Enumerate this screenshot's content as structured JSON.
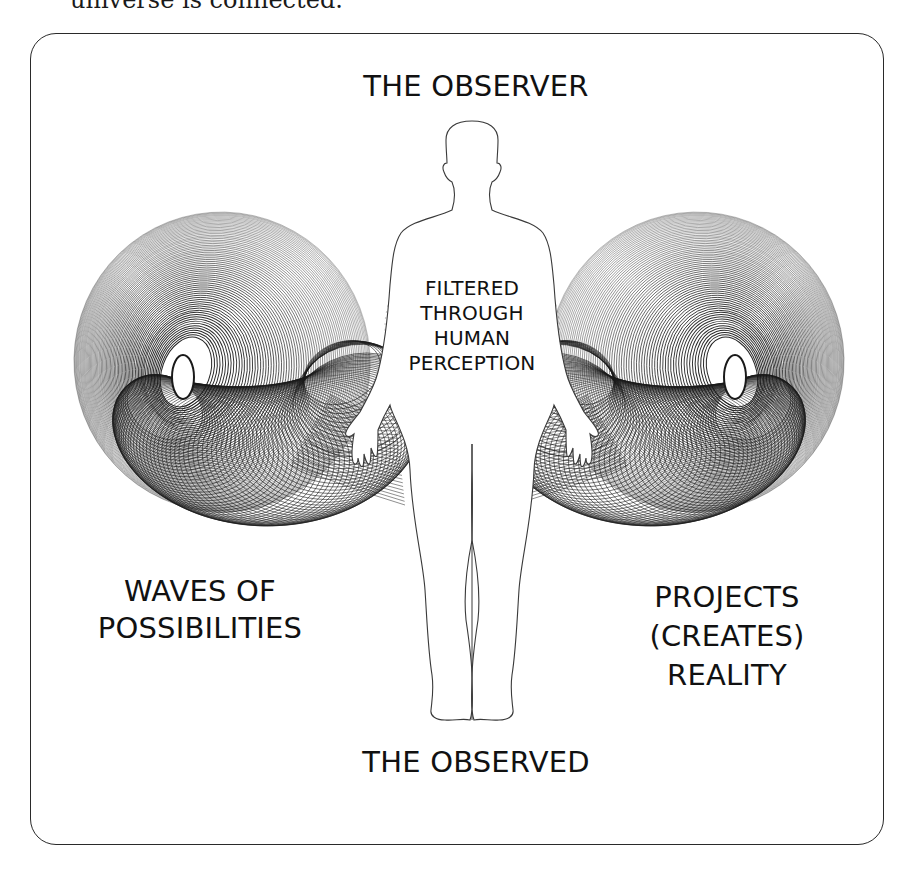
{
  "caption": {
    "text": "universe is connected."
  },
  "diagram": {
    "top_label": "THE OBSERVER",
    "bottom_label": "THE OBSERVED",
    "center_label_lines": [
      "FILTERED",
      "THROUGH",
      "HUMAN",
      "PERCEPTION"
    ],
    "left_label_lines": [
      "WAVES OF",
      "POSSIBILITIES"
    ],
    "right_label_lines": [
      "PROJECTS",
      "(CREATES)",
      "REALITY"
    ]
  },
  "style": {
    "ink": "#1a1a1a",
    "frame": "#2a2a2a",
    "halo": "#c8c8c8",
    "background": "#ffffff"
  },
  "spiral": {
    "left_origin": [
      0,
      0
    ],
    "mirror_axis_x": 459,
    "outer_rings": 70,
    "tail_rings": 80
  }
}
